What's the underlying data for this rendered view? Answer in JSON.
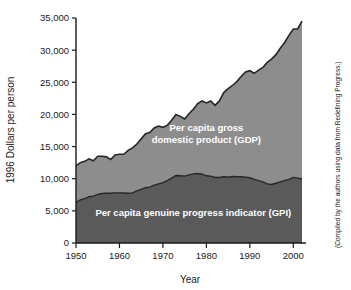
{
  "chart_data": {
    "type": "area",
    "stacked": true,
    "title": "",
    "xlabel": "Year",
    "ylabel": "1996 Dollars per person",
    "xlim": [
      1950,
      2002
    ],
    "ylim": [
      0,
      35000
    ],
    "xticks": [
      1950,
      1960,
      1970,
      1980,
      1990,
      2000
    ],
    "xtick_labels": [
      "1950",
      "1960",
      "1970",
      "1980",
      "1990",
      "2000"
    ],
    "yticks": [
      0,
      5000,
      10000,
      15000,
      20000,
      25000,
      30000,
      35000
    ],
    "ytick_labels": [
      "0",
      "5,000",
      "10,000",
      "15,000",
      "20,000",
      "25,000",
      "30,000",
      "35,000"
    ],
    "grid": false,
    "legend_position": "inline-annotations",
    "annotations": [
      {
        "name": "gdp-band-label",
        "lines": [
          "Per capita gross",
          "domestic product (GDP)"
        ],
        "x": 1980,
        "y": 17500
      },
      {
        "name": "gpi-band-label",
        "lines": [
          "Per capita genuine progress indicator (GPI)"
        ],
        "x": 1977,
        "y": 4200
      }
    ],
    "source_note": "(Compiled by the authors using data from Redefining Progress.)",
    "colors": {
      "gdp_band": "#8d8d8d",
      "gpi_band": "#5a5a5a",
      "curve_line": "#262626",
      "axis": "#1a1a1a",
      "background": "#ffffff",
      "label_text": "#ffffff"
    },
    "x": [
      1950,
      1951,
      1952,
      1953,
      1954,
      1955,
      1956,
      1957,
      1958,
      1959,
      1960,
      1961,
      1962,
      1963,
      1964,
      1965,
      1966,
      1967,
      1968,
      1969,
      1970,
      1971,
      1972,
      1973,
      1974,
      1975,
      1976,
      1977,
      1978,
      1979,
      1980,
      1981,
      1982,
      1983,
      1984,
      1985,
      1986,
      1987,
      1988,
      1989,
      1990,
      1991,
      1992,
      1993,
      1994,
      1995,
      1996,
      1997,
      1998,
      1999,
      2000,
      2001,
      2002
    ],
    "series": [
      {
        "name": "Per capita gross domestic product (GDP)",
        "key": "gdp",
        "color": "#8d8d8d",
        "values": [
          12000,
          12500,
          12700,
          13100,
          12800,
          13500,
          13500,
          13400,
          13000,
          13700,
          13800,
          13800,
          14400,
          14800,
          15400,
          16200,
          17000,
          17200,
          17900,
          18200,
          18000,
          18300,
          19100,
          20000,
          19700,
          19300,
          20100,
          20800,
          21700,
          22100,
          21800,
          22100,
          21400,
          22100,
          23400,
          24000,
          24500,
          25100,
          25900,
          26600,
          26800,
          26400,
          26900,
          27300,
          28100,
          28600,
          29300,
          30300,
          31200,
          32300,
          33300,
          33300,
          34500
        ]
      },
      {
        "name": "Per capita genuine progress indicator (GPI)",
        "key": "gpi",
        "color": "#5a5a5a",
        "values": [
          6300,
          6700,
          6900,
          7200,
          7300,
          7550,
          7700,
          7750,
          7750,
          7800,
          7800,
          7780,
          7750,
          7800,
          8100,
          8350,
          8600,
          8700,
          9000,
          9200,
          9400,
          9700,
          10100,
          10500,
          10450,
          10400,
          10600,
          10750,
          10800,
          10700,
          10450,
          10400,
          10200,
          10200,
          10300,
          10250,
          10350,
          10300,
          10300,
          10250,
          10150,
          9900,
          9700,
          9500,
          9200,
          9100,
          9300,
          9500,
          9700,
          9900,
          10200,
          10100,
          9950
        ]
      }
    ]
  }
}
